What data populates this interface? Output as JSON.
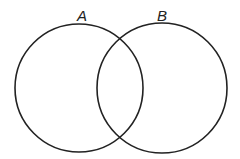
{
  "diagram": {
    "type": "venn",
    "sets": [
      {
        "label": "A",
        "cx": 79,
        "cy": 88,
        "r": 64
      },
      {
        "label": "B",
        "cx": 162,
        "cy": 88,
        "r": 65
      }
    ],
    "stroke_color": "#222222",
    "background": "#ffffff"
  }
}
